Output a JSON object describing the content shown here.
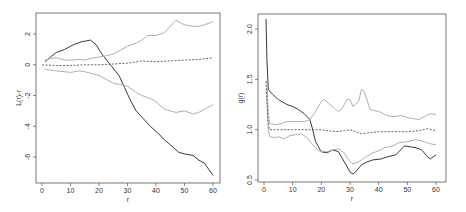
{
  "chart_data": [
    {
      "type": "line",
      "title": "",
      "xlabel": "r",
      "ylabel": "L(r)-r",
      "xlim": [
        0,
        60
      ],
      "ylim": [
        -7.5,
        3.2
      ],
      "xticks": [
        0,
        10,
        20,
        30,
        40,
        50,
        60
      ],
      "yticks": [
        2,
        0,
        -2,
        -4,
        -6
      ],
      "ytick_labels": [
        "2",
        "0",
        "-2",
        "-4",
        "-6"
      ],
      "grid": false,
      "legend": null,
      "frame_px": {
        "left": 36,
        "top": 13,
        "right": 220,
        "bottom": 183
      },
      "axis_map_px": {
        "x0": 42,
        "x60": 213,
        "y_at_2": 34,
        "y_at_minus6": 157
      },
      "series": [
        {
          "name": "observed",
          "style": "solid",
          "color": "#3a3a3a",
          "x": [
            1,
            3,
            5,
            8,
            11,
            14,
            17,
            19,
            21,
            24,
            27,
            29,
            31,
            33,
            35,
            38,
            41,
            43,
            45,
            48,
            50,
            53,
            55,
            57,
            60
          ],
          "y": [
            0.2,
            0.5,
            0.8,
            1.0,
            1.3,
            1.5,
            1.6,
            1.3,
            0.7,
            0.0,
            -0.7,
            -1.5,
            -2.3,
            -3.0,
            -3.4,
            -4.0,
            -4.5,
            -4.9,
            -5.2,
            -5.7,
            -5.8,
            -5.9,
            -6.2,
            -6.4,
            -7.2
          ]
        },
        {
          "name": "upper envelope",
          "style": "solid",
          "color": "#b0b0b0",
          "x": [
            1,
            3,
            5,
            8,
            10,
            13,
            15,
            18,
            20,
            23,
            25,
            28,
            30,
            33,
            35,
            37,
            40,
            43,
            45,
            47,
            50,
            53,
            55,
            57,
            60
          ],
          "y": [
            0.3,
            0.4,
            0.45,
            0.3,
            0.3,
            0.35,
            0.3,
            0.45,
            0.5,
            0.6,
            0.7,
            1.0,
            1.2,
            1.4,
            1.6,
            1.9,
            1.9,
            2.1,
            2.5,
            2.9,
            2.6,
            2.5,
            2.5,
            2.6,
            2.8
          ]
        },
        {
          "name": "lower envelope",
          "style": "solid",
          "color": "#b0b0b0",
          "x": [
            1,
            3,
            5,
            8,
            10,
            13,
            15,
            18,
            20,
            23,
            25,
            28,
            30,
            33,
            35,
            38,
            40,
            43,
            45,
            47,
            50,
            53,
            55,
            57,
            60
          ],
          "y": [
            -0.3,
            -0.35,
            -0.4,
            -0.45,
            -0.5,
            -0.4,
            -0.45,
            -0.6,
            -0.7,
            -1.0,
            -1.2,
            -1.3,
            -1.4,
            -1.8,
            -2.0,
            -2.2,
            -2.4,
            -2.9,
            -3.0,
            -3.1,
            -3.0,
            -3.2,
            -3.1,
            -2.9,
            -2.6
          ]
        },
        {
          "name": "theoretical mean",
          "style": "dashed",
          "color": "#555555",
          "x": [
            0,
            5,
            10,
            15,
            20,
            25,
            30,
            35,
            40,
            45,
            50,
            55,
            60
          ],
          "y": [
            0.0,
            -0.05,
            -0.05,
            0.0,
            0.0,
            0.05,
            0.1,
            0.25,
            0.2,
            0.25,
            0.3,
            0.35,
            0.45
          ]
        }
      ]
    },
    {
      "type": "line",
      "title": "",
      "xlabel": "r",
      "ylabel": "g(r)",
      "xlim": [
        0,
        60
      ],
      "ylim": [
        0.5,
        2.15
      ],
      "xticks": [
        0,
        10,
        20,
        30,
        40,
        50,
        60
      ],
      "yticks": [
        2.0,
        1.5,
        1.0,
        0.5
      ],
      "ytick_labels": [
        "2.0",
        "1.5",
        "1.0",
        "0.5"
      ],
      "grid": false,
      "legend": null,
      "frame_px": {
        "left": 258,
        "top": 14,
        "right": 446,
        "bottom": 182
      },
      "axis_map_px": {
        "x0": 264,
        "x60": 436,
        "y_at_2": 29,
        "y_at_0.5": 180
      },
      "series": [
        {
          "name": "observed",
          "style": "solid",
          "color": "#3a3a3a",
          "x": [
            0.7,
            1.0,
            1.5,
            3,
            5,
            8,
            10,
            12,
            14,
            16,
            17,
            18,
            20,
            22,
            24,
            26,
            28,
            30,
            31,
            32,
            34,
            36,
            38,
            41,
            43,
            46,
            49,
            51,
            53,
            55,
            57,
            58,
            60
          ],
          "y": [
            2.1,
            1.7,
            1.4,
            1.35,
            1.3,
            1.25,
            1.23,
            1.2,
            1.16,
            1.1,
            1.0,
            0.88,
            0.78,
            0.77,
            0.8,
            0.78,
            0.68,
            0.58,
            0.56,
            0.58,
            0.65,
            0.68,
            0.7,
            0.71,
            0.73,
            0.75,
            0.84,
            0.83,
            0.82,
            0.8,
            0.73,
            0.71,
            0.75
          ]
        },
        {
          "name": "upper envelope",
          "style": "solid",
          "color": "#b0b0b0",
          "x": [
            1.0,
            1.5,
            2,
            4,
            6,
            8,
            11,
            14,
            16,
            18,
            20,
            21,
            23,
            25,
            26,
            27,
            29,
            30,
            31,
            33,
            34,
            35,
            37,
            40,
            43,
            45,
            48,
            50,
            52,
            54,
            56,
            58,
            60
          ],
          "y": [
            1.5,
            1.15,
            1.06,
            1.05,
            1.06,
            1.08,
            1.08,
            1.08,
            1.1,
            1.18,
            1.28,
            1.3,
            1.25,
            1.2,
            1.18,
            1.2,
            1.3,
            1.3,
            1.23,
            1.28,
            1.4,
            1.38,
            1.2,
            1.18,
            1.14,
            1.13,
            1.14,
            1.12,
            1.11,
            1.1,
            1.13,
            1.16,
            1.15
          ]
        },
        {
          "name": "lower envelope",
          "style": "solid",
          "color": "#b0b0b0",
          "x": [
            1.0,
            1.5,
            2,
            4,
            5,
            7,
            9,
            11,
            13,
            15,
            17,
            19,
            22,
            24,
            26,
            28,
            29,
            31,
            33,
            35,
            38,
            40,
            42,
            45,
            47,
            50,
            53,
            56,
            58,
            60
          ],
          "y": [
            1.4,
            1.0,
            0.93,
            0.92,
            0.93,
            0.91,
            0.94,
            0.95,
            0.96,
            0.92,
            0.85,
            0.79,
            0.78,
            0.8,
            0.81,
            0.77,
            0.72,
            0.66,
            0.68,
            0.72,
            0.77,
            0.79,
            0.82,
            0.84,
            0.87,
            0.88,
            0.9,
            0.88,
            0.86,
            0.85
          ]
        },
        {
          "name": "theoretical mean",
          "style": "dashed",
          "color": "#555555",
          "x": [
            0.7,
            1.0,
            1.5,
            2,
            5,
            10,
            15,
            20,
            25,
            28,
            30,
            32,
            34,
            37,
            40,
            45,
            50,
            54,
            57,
            60
          ],
          "y": [
            1.48,
            1.25,
            1.05,
            1.0,
            1.0,
            1.0,
            1.0,
            1.0,
            0.98,
            0.99,
            1.0,
            0.98,
            0.96,
            0.97,
            0.98,
            0.98,
            0.98,
            0.99,
            1.01,
            0.99
          ]
        }
      ]
    }
  ],
  "panels": [
    {
      "xlabel": "r",
      "ylabel": "L(r)-r",
      "xtick_labels": [
        "0",
        "10",
        "20",
        "30",
        "40",
        "50",
        "60"
      ]
    },
    {
      "xlabel": "r",
      "ylabel": "g(r)",
      "xtick_labels": [
        "0",
        "10",
        "20",
        "30",
        "40",
        "50",
        "60"
      ]
    }
  ]
}
